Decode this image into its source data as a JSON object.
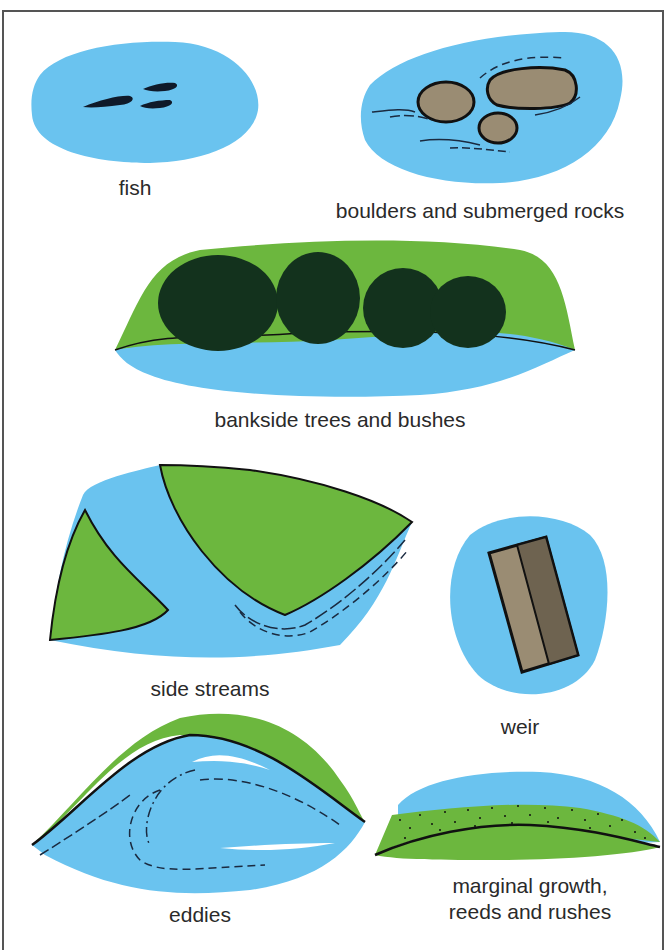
{
  "colors": {
    "water": "#6ac3ef",
    "land": "#6cb73e",
    "rock": "#9a8c73",
    "rock_dark": "#6e6350",
    "tree": "#13321d",
    "outline": "#111111"
  },
  "panels": [
    {
      "id": "fish",
      "label": "fish"
    },
    {
      "id": "boulders",
      "label": "boulders and submerged rocks"
    },
    {
      "id": "trees",
      "label": "bankside trees and bushes"
    },
    {
      "id": "side-streams",
      "label": "side streams"
    },
    {
      "id": "weir",
      "label": "weir"
    },
    {
      "id": "eddies",
      "label": "eddies"
    },
    {
      "id": "marginal",
      "label_line1": "marginal growth,",
      "label_line2": "reeds and rushes"
    }
  ]
}
